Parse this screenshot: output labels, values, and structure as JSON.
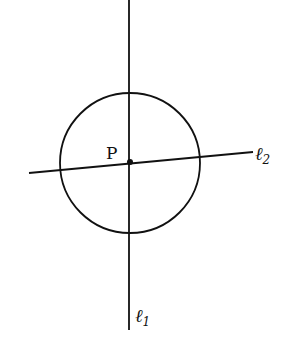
{
  "diagram": {
    "point_label": "P",
    "line1_label": "ℓ",
    "line1_sub": "1",
    "line2_label": "ℓ",
    "line2_sub": "2",
    "stroke_color": "#111111",
    "background": "#ffffff",
    "circle": {
      "cx": 130,
      "cy": 163,
      "r": 70
    },
    "line1": {
      "x1": 129,
      "y1": 0,
      "x2": 129,
      "y2": 330
    },
    "line2": {
      "x1": 29,
      "y1": 173,
      "x2": 253,
      "y2": 152
    }
  }
}
